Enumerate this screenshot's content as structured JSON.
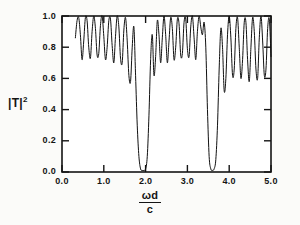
{
  "chart_data": {
    "type": "line",
    "title": "",
    "xlabel": "ωd/c",
    "xlabel_numerator": "ωd",
    "xlabel_denominator": "c",
    "ylabel": "|T|²",
    "ylabel_base": "|T|",
    "ylabel_exponent": "2",
    "xlim": [
      0.0,
      5.0
    ],
    "ylim": [
      0.0,
      1.0
    ],
    "xticks": [
      0.0,
      1.0,
      2.0,
      3.0,
      4.0,
      5.0
    ],
    "xtick_labels": [
      "0.0",
      "1.0",
      "2.0",
      "3.0",
      "4.0",
      "5.0"
    ],
    "yticks": [
      0.0,
      0.2,
      0.4,
      0.6,
      0.8,
      1.0
    ],
    "ytick_labels": [
      "0.0",
      "0.2",
      "0.4",
      "0.6",
      "0.8",
      "1.0"
    ],
    "grid": false,
    "legend": null,
    "line_color": "#111111",
    "line_width": 1.0,
    "data_start_x": 0.32,
    "series": [
      {
        "name": "|T|^2",
        "x": [
          0.32,
          0.36,
          0.4,
          0.44,
          0.48,
          0.52,
          0.56,
          0.6,
          0.64,
          0.68,
          0.72,
          0.76,
          0.8,
          0.84,
          0.88,
          0.92,
          0.96,
          1.0,
          1.04,
          1.08,
          1.12,
          1.16,
          1.2,
          1.24,
          1.28,
          1.32,
          1.36,
          1.4,
          1.44,
          1.48,
          1.52,
          1.56,
          1.6,
          1.64,
          1.68,
          1.72,
          1.76,
          1.8,
          1.84,
          1.88,
          1.92,
          1.96,
          2.0,
          2.04,
          2.08,
          2.12,
          2.16,
          2.2,
          2.24,
          2.28,
          2.32,
          2.36,
          2.4,
          2.44,
          2.48,
          2.52,
          2.56,
          2.6,
          2.64,
          2.68,
          2.72,
          2.76,
          2.8,
          2.84,
          2.88,
          2.92,
          2.96,
          3.0,
          3.04,
          3.08,
          3.12,
          3.16,
          3.2,
          3.24,
          3.28,
          3.32,
          3.36,
          3.4,
          3.44,
          3.48,
          3.52,
          3.56,
          3.6,
          3.64,
          3.68,
          3.72,
          3.76,
          3.8,
          3.84,
          3.88,
          3.92,
          3.96,
          4.0,
          4.04,
          4.08,
          4.12,
          4.16,
          4.2,
          4.24,
          4.28,
          4.32,
          4.36,
          4.4,
          4.44,
          4.48,
          4.52,
          4.56,
          4.6,
          4.64,
          4.68,
          4.72,
          4.76,
          4.8,
          4.84,
          4.88,
          4.92,
          4.96,
          5.0
        ],
        "y": [
          0.86,
          0.97,
          0.99,
          0.88,
          0.72,
          0.84,
          0.99,
          0.97,
          0.8,
          0.73,
          0.9,
          1.0,
          0.92,
          0.75,
          0.76,
          0.94,
          1.0,
          0.87,
          0.72,
          0.8,
          0.97,
          0.98,
          0.81,
          0.7,
          0.87,
          1.0,
          0.93,
          0.73,
          0.7,
          0.91,
          0.99,
          0.84,
          0.62,
          0.58,
          0.8,
          0.93,
          0.62,
          0.3,
          0.1,
          0.02,
          0.01,
          0.01,
          0.02,
          0.1,
          0.36,
          0.72,
          0.88,
          0.62,
          0.74,
          0.97,
          0.88,
          0.7,
          0.86,
          1.0,
          0.88,
          0.7,
          0.84,
          0.99,
          0.92,
          0.72,
          0.8,
          0.98,
          0.95,
          0.75,
          0.76,
          0.96,
          0.98,
          0.79,
          0.74,
          0.93,
          1.0,
          0.86,
          0.72,
          0.9,
          1.0,
          0.93,
          0.88,
          0.96,
          0.8,
          0.4,
          0.1,
          0.02,
          0.01,
          0.02,
          0.08,
          0.3,
          0.66,
          0.92,
          0.8,
          0.52,
          0.6,
          0.88,
          1.0,
          0.86,
          0.62,
          0.66,
          0.92,
          0.99,
          0.8,
          0.6,
          0.72,
          0.96,
          0.96,
          0.72,
          0.58,
          0.8,
          0.99,
          0.9,
          0.66,
          0.6,
          0.86,
          1.0,
          0.84,
          0.62,
          0.66,
          0.92,
          0.98,
          0.74
        ]
      }
    ],
    "bands": [
      {
        "name": "pass-band-1",
        "range": [
          0.32,
          1.72
        ]
      },
      {
        "name": "stop-band-1",
        "range": [
          1.76,
          2.12
        ],
        "center": 1.92,
        "depth": 0.01
      },
      {
        "name": "pass-band-2",
        "range": [
          2.16,
          3.44
        ]
      },
      {
        "name": "stop-band-2",
        "range": [
          3.48,
          3.8
        ],
        "center": 3.62,
        "depth": 0.01
      },
      {
        "name": "pass-band-3",
        "range": [
          3.84,
          5.0
        ]
      }
    ]
  }
}
